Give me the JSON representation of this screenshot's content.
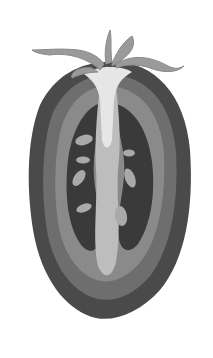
{
  "image": {
    "subject": "Halved tomato cross-section illustration",
    "style": "grayscale watercolor",
    "colors": {
      "background": "#ffffff",
      "skin": "#4a4a4a",
      "outer_flesh": "#6e6e6e",
      "inner_wall": "#8a8a8a",
      "locule": "#3a3a3a",
      "core": "#bdbdbd",
      "core_top": "#e6e6e6",
      "seeds": "#a9a9a9",
      "stem": "#9a9a9a"
    }
  }
}
